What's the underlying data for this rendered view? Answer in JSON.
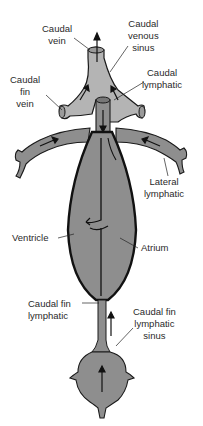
{
  "diagram": {
    "colors": {
      "venous_sinus": "#b4b4b4",
      "lymphatic": "#8e8e8e",
      "heart_outline": "#111111",
      "label_text": "#2a2a2a",
      "background": "#ffffff"
    },
    "labels": {
      "caudal_vein": [
        "Caudal",
        "vein"
      ],
      "caudal_venous_sinus": [
        "Caudal",
        "venous",
        "sinus"
      ],
      "caudal_fin_vein": [
        "Caudal",
        "fin",
        "vein"
      ],
      "caudal_lymphatic": [
        "Caudal",
        "lymphatic"
      ],
      "lateral_lymphatic": [
        "Lateral",
        "lymphatic"
      ],
      "ventricle": [
        "Ventricle"
      ],
      "atrium": [
        "Atrium"
      ],
      "caudal_fin_lymphatic": [
        "Caudal fin",
        "lymphatic"
      ],
      "caudal_fin_lymphatic_sinus": [
        "Caudal fin",
        "lymphatic",
        "sinus"
      ]
    },
    "flow_arrows": [
      {
        "location": "caudal vein outlet",
        "direction": "up"
      },
      {
        "location": "venous sinus left",
        "direction": "up-right"
      },
      {
        "location": "venous sinus right",
        "direction": "up-left"
      },
      {
        "location": "caudal lymphatic",
        "direction": "down"
      },
      {
        "location": "left lateral lymphatic",
        "direction": "toward heart"
      },
      {
        "location": "right lateral lymphatic",
        "direction": "toward heart"
      },
      {
        "location": "caudal fin lymphatic",
        "direction": "up"
      },
      {
        "location": "caudal fin lymphatic sinus",
        "direction": "up"
      }
    ]
  }
}
